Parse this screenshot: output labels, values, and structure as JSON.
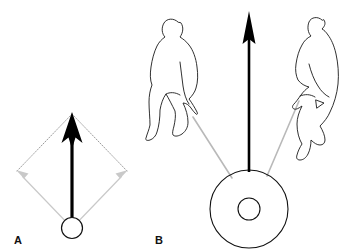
{
  "figure": {
    "background_color": "#ffffff",
    "width": 363,
    "height": 252
  },
  "colors": {
    "resultant_vector": "#000000",
    "component_vector": "#c9c9c9",
    "construction_line": "#9a9a9a",
    "rope": "#b9b9b9",
    "figure_outline": "#1a1a1a",
    "tire_outline": "#111111",
    "label_text": "#111111"
  },
  "panels": [
    {
      "id": "A",
      "label": "A",
      "label_position": {
        "x": 14,
        "y": 243
      },
      "description": "Parallelogram law of vector addition",
      "origin": {
        "x": 72,
        "y": 228,
        "radius": 11,
        "name": "point-of-application"
      },
      "resultant": {
        "name": "resultant-vector",
        "from": {
          "x": 72,
          "y": 228
        },
        "to": {
          "x": 72,
          "y": 114
        },
        "color": "#000000",
        "shaft_width": 3.2,
        "head_width": 17,
        "head_length": 26
      },
      "components": [
        {
          "name": "component-vector-left",
          "from": {
            "x": 72,
            "y": 228
          },
          "to": {
            "x": 17,
            "y": 171
          },
          "color": "#c9c9c9"
        },
        {
          "name": "component-vector-right",
          "from": {
            "x": 72,
            "y": 228
          },
          "to": {
            "x": 127,
            "y": 171
          },
          "color": "#c9c9c9"
        }
      ],
      "construction_lines": [
        {
          "name": "dotted-edge-upper-left",
          "from": {
            "x": 17,
            "y": 171
          },
          "to": {
            "x": 72,
            "y": 114
          }
        },
        {
          "name": "dotted-edge-upper-right",
          "from": {
            "x": 127,
            "y": 171
          },
          "to": {
            "x": 72,
            "y": 114
          }
        }
      ]
    },
    {
      "id": "B",
      "label": "B",
      "label_position": {
        "x": 155,
        "y": 243
      },
      "description": "Two people pulling ropes attached to a tire, producing an upward resultant force",
      "tire": {
        "name": "tire",
        "center": {
          "x": 249,
          "y": 209
        },
        "outer_radius": 39,
        "inner_radius": 11
      },
      "resultant": {
        "name": "resultant-vector",
        "from": {
          "x": 249,
          "y": 172
        },
        "to": {
          "x": 249,
          "y": 12
        },
        "color": "#000000",
        "shaft_width": 2.6,
        "head_width": 13,
        "head_length": 30
      },
      "ropes": [
        {
          "name": "rope-left",
          "from": {
            "x": 192,
            "y": 116
          },
          "to": {
            "x": 231,
            "y": 177
          },
          "color": "#b9b9b9"
        },
        {
          "name": "rope-right",
          "from": {
            "x": 300,
            "y": 100
          },
          "to": {
            "x": 268,
            "y": 175
          },
          "color": "#b9b9b9"
        }
      ],
      "people": [
        {
          "name": "person-left",
          "pose": "leaning-back-pulling-rope",
          "facing": "right"
        },
        {
          "name": "person-right",
          "pose": "leaning-back-pulling-rope",
          "facing": "left"
        }
      ]
    }
  ]
}
